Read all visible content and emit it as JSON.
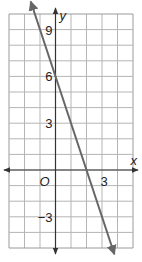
{
  "chart_data": {
    "type": "line",
    "title": "",
    "xlabel": "x",
    "ylabel": "y",
    "xlim": [
      -3,
      5
    ],
    "ylim": [
      -5,
      10
    ],
    "grid": true,
    "grid_step": 1,
    "x_tick_labels": [
      {
        "value": 3,
        "label": "3"
      }
    ],
    "y_tick_labels": [
      {
        "value": 9,
        "label": "9"
      },
      {
        "value": 6,
        "label": "6"
      },
      {
        "value": 3,
        "label": "3"
      },
      {
        "value": -3,
        "label": "−3"
      }
    ],
    "origin_label": "O",
    "series": [
      {
        "name": "line",
        "equation": "y = -3x + 6",
        "slope": -3,
        "intercept": 6,
        "x": [
          -1.6,
          3.8
        ],
        "y": [
          10.8,
          -5.4
        ],
        "arrows": "both",
        "color": "#666666"
      }
    ]
  },
  "colors": {
    "grid": "#b5b5b5",
    "axis": "#333333",
    "line": "#666666",
    "border": "#9a9a9a"
  }
}
